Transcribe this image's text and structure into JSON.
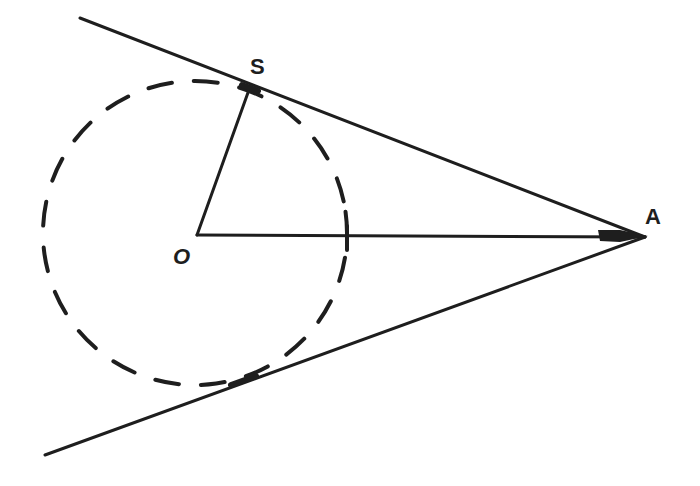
{
  "diagram": {
    "title": "",
    "stroke_color": "#1e1e1e",
    "background": "#ffffff",
    "points": {
      "O": {
        "label": "O",
        "x": 197,
        "y": 235
      },
      "S": {
        "label": "S",
        "x": 250,
        "y": 87
      },
      "A": {
        "label": "A",
        "x": 645,
        "y": 237
      }
    },
    "circle": {
      "style": "dashed",
      "cx": 195,
      "cy": 233,
      "r": 152
    },
    "lines": [
      {
        "name": "upper-tangent",
        "x1": 80,
        "y1": 18,
        "x2": 645,
        "y2": 237
      },
      {
        "name": "lower-tangent",
        "x1": 45,
        "y1": 455,
        "x2": 645,
        "y2": 237
      },
      {
        "name": "radius-OS",
        "x1": 197,
        "y1": 235,
        "x2": 250,
        "y2": 87
      },
      {
        "name": "segment-OA",
        "x1": 197,
        "y1": 235,
        "x2": 645,
        "y2": 237
      }
    ]
  }
}
